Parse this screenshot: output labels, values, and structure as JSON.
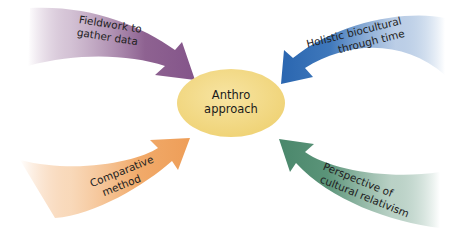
{
  "diagram": {
    "center": {
      "line1": "Anthro",
      "line2": "approach",
      "fill": "#f0d77a"
    },
    "arrows": [
      {
        "id": "fieldwork",
        "line1": "Fieldwork to",
        "line2": "gather data",
        "color": "#8a5a8e",
        "position": "top-left"
      },
      {
        "id": "holistic",
        "line1": "Holistic biocultural",
        "line2": "through time",
        "color": "#2e6bb3",
        "position": "top-right"
      },
      {
        "id": "comparative",
        "line1": "Comparative",
        "line2": "method",
        "color": "#f0a25e",
        "position": "bottom-left"
      },
      {
        "id": "relativism",
        "line1": "Perspective of",
        "line2": "cultural relativism",
        "color": "#4d8a6f",
        "position": "bottom-right"
      }
    ]
  }
}
